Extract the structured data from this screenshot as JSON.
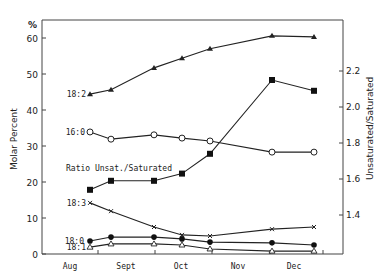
{
  "chart_data": {
    "type": "line",
    "title": "",
    "xlabel": "",
    "ylabel": "Molar Percent",
    "ylabel_unit": "%",
    "y2label": "Unsaturated/Saturated",
    "x_categories": [
      "Aug",
      "Sept",
      "Oct",
      "Nov",
      "Dec"
    ],
    "ylim": [
      0,
      60
    ],
    "yticks": [
      0,
      10,
      20,
      30,
      40,
      50,
      60
    ],
    "y2lim": [
      1.4,
      2.2
    ],
    "y2ticks": [
      "1.4",
      "1.6",
      "1.8",
      "2.0",
      "2.2"
    ],
    "x_sample_pixels": [
      90,
      111,
      154,
      182,
      210,
      272,
      314
    ],
    "series": [
      {
        "name": "18:2",
        "axis": "left",
        "marker": "filled-triangle",
        "values": [
          44.4,
          45.6,
          51.7,
          54.4,
          57.0,
          60.6,
          60.3
        ]
      },
      {
        "name": "16:0",
        "axis": "left",
        "marker": "open-circle",
        "values": [
          33.9,
          31.9,
          33.1,
          32.2,
          31.4,
          28.3,
          28.3
        ]
      },
      {
        "name": "Ratio Unsat./Saturated",
        "axis": "right",
        "marker": "filled-square",
        "values": [
          1.54,
          1.59,
          1.59,
          1.63,
          1.74,
          2.15,
          2.09
        ]
      },
      {
        "name": "18:3",
        "axis": "left",
        "marker": "cross",
        "values": [
          14.2,
          11.9,
          7.5,
          5.3,
          5.0,
          6.9,
          7.5
        ]
      },
      {
        "name": "18:0",
        "axis": "left",
        "marker": "filled-circle",
        "values": [
          3.6,
          4.7,
          4.7,
          4.2,
          3.3,
          3.1,
          2.5
        ]
      },
      {
        "name": "18:1",
        "axis": "left",
        "marker": "open-triangle",
        "values": [
          1.9,
          2.8,
          2.8,
          2.5,
          1.4,
          0.8,
          0.8
        ]
      }
    ],
    "annotations": [
      "18:2",
      "16:0",
      "Ratio Unsat./Saturated",
      "18:3",
      "18:0",
      "18:1"
    ],
    "grid": false,
    "legend": "inline labels"
  },
  "labels": {
    "y_unit": "%",
    "y_title": "Molar Percent",
    "y2_title": "Unsaturated/Saturated",
    "ratio_label": "Ratio Unsat./Saturated"
  }
}
